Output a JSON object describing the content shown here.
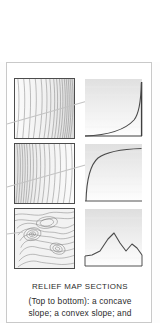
{
  "figure": {
    "caption_title": "RELIEF MAP SECTIONS",
    "caption_lines": [
      "(Top to bottom): a concave",
      "slope; a convex slope; and"
    ],
    "colors": {
      "page_background": "#ffffff",
      "card_border": "#c9c9c9",
      "map_border": "#4c4c4c",
      "contour_line": "#6e6e6e",
      "profile_line": "#4a4a4a",
      "transect_line": "#bdbdbd",
      "shade_top": "#e2e2e2",
      "shade_bottom": "#ffffff"
    },
    "rows": [
      {
        "label": "concave-slope",
        "map": {
          "name": "contour-map-concave",
          "description": "closely spaced parallel contour lines, widening to the left",
          "contour_count": 16,
          "has_transect_line": true
        },
        "profile": {
          "name": "profile-concave",
          "description": "concave slope profile: gentle at left, rising steeply at right",
          "curve": "concave",
          "points": [
            [
              0,
              0
            ],
            [
              20,
              2
            ],
            [
              40,
              6
            ],
            [
              58,
              13
            ],
            [
              72,
              24
            ],
            [
              84,
              44
            ],
            [
              92,
              70
            ],
            [
              97,
              100
            ]
          ]
        }
      },
      {
        "label": "convex-slope",
        "map": {
          "name": "contour-map-convex",
          "description": "contour lines tightly packed at the left, spreading toward the right",
          "contour_count": 16,
          "has_transect_line": true
        },
        "profile": {
          "name": "profile-convex",
          "description": "convex slope profile: steep rise at left, flattening toward the right",
          "curve": "convex",
          "points": [
            [
              2,
              0
            ],
            [
              6,
              32
            ],
            [
              12,
              56
            ],
            [
              22,
              72
            ],
            [
              38,
              82
            ],
            [
              58,
              88
            ],
            [
              78,
              91
            ],
            [
              100,
              93
            ]
          ]
        }
      },
      {
        "label": "irregular-relief",
        "map": {
          "name": "contour-map-irregular",
          "description": "irregular closed contour loops depicting two hills and a basin",
          "contour_count": 22,
          "has_transect_line": true
        },
        "profile": {
          "name": "profile-irregular",
          "description": "irregular profile with two peaks separated by a saddle",
          "curve": "irregular",
          "points": [
            [
              0,
              10
            ],
            [
              10,
              12
            ],
            [
              22,
              30
            ],
            [
              34,
              58
            ],
            [
              44,
              40
            ],
            [
              54,
              22
            ],
            [
              64,
              34
            ],
            [
              74,
              50
            ],
            [
              84,
              30
            ],
            [
              94,
              14
            ],
            [
              100,
              12
            ]
          ]
        }
      }
    ]
  }
}
